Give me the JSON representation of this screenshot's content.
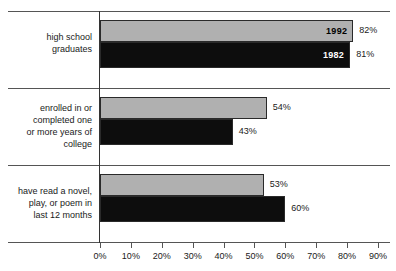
{
  "chart_data": {
    "type": "bar",
    "orientation": "horizontal",
    "title": "",
    "subtitle": "",
    "xlabel": "",
    "ylabel": "",
    "xlim": [
      0,
      90
    ],
    "grid": false,
    "legend_position": "in-bar",
    "categories": [
      "high school\ngraduates",
      "enrolled in or\ncompleted one\nor more years of\ncollege",
      "have read a novel,\nplay, or poem in\nlast 12 months"
    ],
    "series": [
      {
        "name": "1992",
        "color": "#b0b0b0",
        "values": [
          82,
          54,
          53
        ]
      },
      {
        "name": "1982",
        "color": "#0d0d0d",
        "values": [
          81,
          43,
          60
        ]
      }
    ],
    "xticks": [
      0,
      10,
      20,
      30,
      40,
      50,
      60,
      70,
      80,
      90
    ],
    "xtick_labels": [
      "0%",
      "10%",
      "20%",
      "30%",
      "40%",
      "50%",
      "60%",
      "70%",
      "80%",
      "90%"
    ],
    "value_labels": [
      [
        "82%",
        "54%",
        "53%"
      ],
      [
        "81%",
        "43%",
        "60%"
      ]
    ]
  },
  "categories": {
    "row0": {
      "line0": "high school",
      "line1": "graduates"
    },
    "row1": {
      "line0": "enrolled in or",
      "line1": "completed one",
      "line2": "or more years of",
      "line3": "college"
    },
    "row2": {
      "line0": "have read a novel,",
      "line1": "play, or poem in",
      "line2": "last 12 months"
    }
  },
  "series_tags": {
    "newer": "1992",
    "older": "1982"
  },
  "values": {
    "g0s0": "82%",
    "g0s1": "81%",
    "g1s0": "54%",
    "g1s1": "43%",
    "g2s0": "53%",
    "g2s1": "60%"
  },
  "axis": {
    "t0": "0%",
    "t1": "10%",
    "t2": "20%",
    "t3": "30%",
    "t4": "40%",
    "t5": "50%",
    "t6": "60%",
    "t7": "70%",
    "t8": "80%",
    "t9": "90%"
  },
  "colors": {
    "series_newer": "#b0b0b0",
    "series_older": "#0d0d0d",
    "axis": "#555555",
    "text": "#1a1a1a",
    "background": "#ffffff"
  }
}
